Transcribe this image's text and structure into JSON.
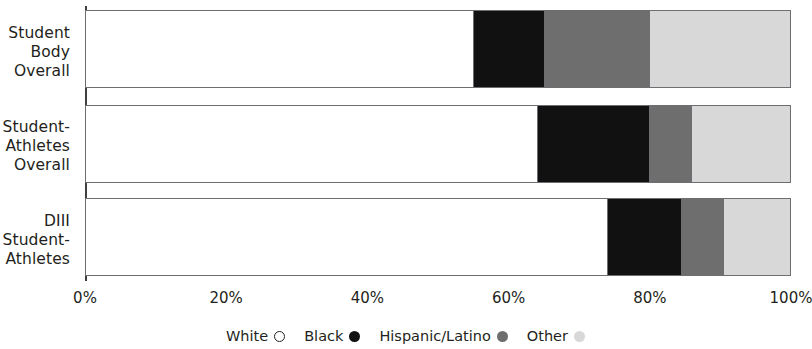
{
  "chart_data": {
    "type": "bar",
    "orientation": "horizontal",
    "stacked": true,
    "stack_mode": "percent",
    "title": "",
    "subtitle": "",
    "xlabel": "",
    "ylabel": "",
    "xlim": [
      0,
      100
    ],
    "grid": false,
    "legend_position": "bottom",
    "categories": [
      "Student\nBody\nOverall",
      "Student-\nAthletes\nOverall",
      "DIII\nStudent-\nAthletes"
    ],
    "category_lines": [
      [
        "Student",
        "Body",
        "Overall"
      ],
      [
        "Student-",
        "Athletes",
        "Overall"
      ],
      [
        "DIII",
        "Student-",
        "Athletes"
      ]
    ],
    "xticks": [
      0,
      20,
      40,
      60,
      80,
      100
    ],
    "xtick_labels": [
      "0%",
      "20%",
      "40%",
      "60%",
      "80%",
      "100%"
    ],
    "series": [
      {
        "name": "White",
        "color": "#ffffff",
        "marker": "open-circle",
        "values": [
          55,
          64,
          74
        ]
      },
      {
        "name": "Black",
        "color": "#111111",
        "marker": "filled-circle",
        "values": [
          10,
          16,
          10.5
        ]
      },
      {
        "name": "Hispanic/Latino",
        "color": "#6e6e6e",
        "marker": "filled-circle",
        "values": [
          15,
          6,
          6
        ]
      },
      {
        "name": "Other",
        "color": "#d8d8d8",
        "marker": "filled-circle",
        "values": [
          20,
          14,
          9.5
        ]
      }
    ]
  },
  "legend": {
    "items": [
      {
        "label": "White",
        "color": "#ffffff",
        "style": "outline"
      },
      {
        "label": "Black",
        "color": "#111111",
        "style": "solid"
      },
      {
        "label": "Hispanic/Latino",
        "color": "#6e6e6e",
        "style": "solid"
      },
      {
        "label": "Other",
        "color": "#d8d8d8",
        "style": "solid"
      }
    ]
  },
  "axis": {
    "line_color": "#3f3f42",
    "bar_border_color": "#6d6e71"
  }
}
